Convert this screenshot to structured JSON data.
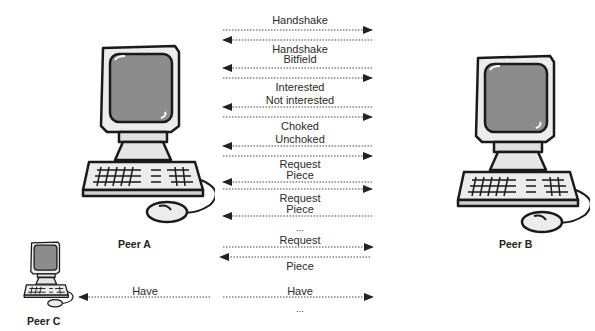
{
  "peers": {
    "a": {
      "label": "Peer A"
    },
    "b": {
      "label": "Peer B"
    },
    "c": {
      "label": "Peer C"
    }
  },
  "messages": [
    {
      "label": "Handshake",
      "direction": "A-to-B"
    },
    {
      "label": "Handshake",
      "direction": "B-to-A"
    },
    {
      "label": "Bitfield",
      "direction": "B-to-A"
    },
    {
      "label": "Bitfield",
      "direction": "A-to-B"
    },
    {
      "label": "Interested",
      "direction": "A-to-B"
    },
    {
      "label": "Not interested",
      "direction": "B-to-A"
    },
    {
      "label": "Choked",
      "direction": "A-to-B"
    },
    {
      "label": "Unchoked",
      "direction": "B-to-A"
    },
    {
      "label": "Request",
      "direction": "A-to-B"
    },
    {
      "label": "Piece",
      "direction": "B-to-A"
    },
    {
      "label": "Request",
      "direction": "A-to-B"
    },
    {
      "label": "Piece",
      "direction": "B-to-A"
    },
    {
      "label": "...",
      "direction": "none"
    },
    {
      "label": "Request",
      "direction": "A-to-B"
    },
    {
      "label": "Piece",
      "direction": "B-to-A"
    },
    {
      "label": "Have",
      "direction": "A-to-C"
    },
    {
      "label": "Have",
      "direction": "A-to-B"
    },
    {
      "label": "...",
      "direction": "none"
    }
  ],
  "text": {
    "handshake_1": "Handshake",
    "handshake_2": "Handshake",
    "bitfield": "Bitfield",
    "interested": "Interested",
    "not_interested": "Not interested",
    "choked": "Choked",
    "unchoked": "Unchoked",
    "request_1": "Request",
    "piece_1": "Piece",
    "request_2": "Request",
    "piece_2": "Piece",
    "ellipsis_1": "...",
    "request_3": "Request",
    "piece_3": "Piece",
    "have_c": "Have",
    "have_b": "Have",
    "ellipsis_2": "..."
  },
  "colors": {
    "line": "#333333",
    "screen": "#8a8a8a",
    "body": "#e6e6e6",
    "outline": "#1a1a1a"
  }
}
